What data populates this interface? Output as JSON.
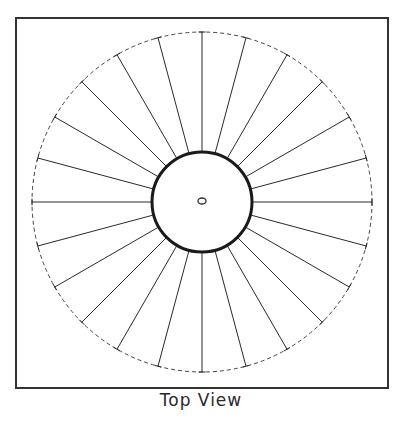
{
  "diagram": {
    "caption": "Top View",
    "spoke_count": 24,
    "colors": {
      "ink": "#2a2a2a",
      "frame": "#333333",
      "background": "#ffffff"
    },
    "elements": {
      "frame": "rectangular border",
      "outer_circle": "dashed circle",
      "hub": "solid thick circle",
      "center_hole": "small ellipse",
      "spokes": "radial lines with end caps"
    }
  }
}
